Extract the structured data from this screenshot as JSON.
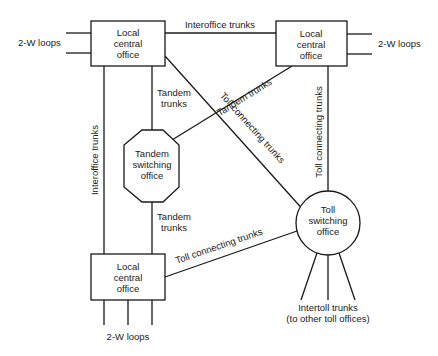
{
  "diagram": {
    "nodes": {
      "local_top_left": {
        "lines": [
          "Local",
          "central",
          "office"
        ]
      },
      "local_top_right": {
        "lines": [
          "Local",
          "central",
          "office"
        ]
      },
      "local_bottom_left": {
        "lines": [
          "Local",
          "central",
          "office"
        ]
      },
      "tandem": {
        "lines": [
          "Tandem",
          "switching",
          "office"
        ]
      },
      "toll": {
        "lines": [
          "Toll",
          "switching",
          "office"
        ]
      }
    },
    "labels": {
      "loops_left": "2-W loops",
      "loops_right": "2-W loops",
      "loops_bottom": "2-W loops",
      "interoffice_top": "Interoffice trunks",
      "interoffice_left": "Interoffice trunks",
      "tandem_upper": [
        "Tandem",
        "trunks"
      ],
      "tandem_lower": [
        "Tandem",
        "trunks"
      ],
      "tandem_diag": "Tandem trunks",
      "toll_diag": "Toll connecting trunks",
      "toll_vertical": "Toll connecting trunks",
      "toll_bottom": "Toll connecting trunks",
      "intertoll": [
        "Intertoll trunks",
        "(to other toll offices)"
      ]
    },
    "colors": {
      "stroke": "#1a1a1a",
      "background": "#ffffff"
    }
  }
}
